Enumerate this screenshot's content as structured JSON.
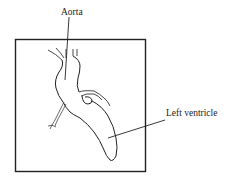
{
  "figure": {
    "labels": {
      "aorta": "Aorta",
      "left_ventricle": "Left ventricle"
    },
    "colors": {
      "line": "#222222",
      "background": "#ffffff"
    }
  }
}
